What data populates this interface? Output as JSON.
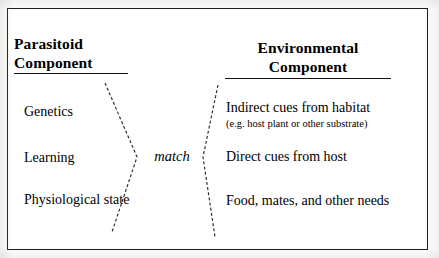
{
  "figure": {
    "border_color": "#1a1a1a",
    "background_color": "#ffffff",
    "text_color": "#000000",
    "connector_color": "#2b2b2b"
  },
  "columns": {
    "left": {
      "header_line1": "Parasitoid",
      "header_line2": "Component",
      "entries": [
        {
          "label": "Genetics"
        },
        {
          "label": "Learning"
        },
        {
          "label": "Physiological state"
        }
      ]
    },
    "right": {
      "header_line1": "Environmental",
      "header_line2": "Component",
      "entries": [
        {
          "label": "Indirect cues from habitat",
          "sublabel": "(e.g. host plant or other substrate)"
        },
        {
          "label": "Direct cues from host",
          "sublabel": ""
        },
        {
          "label": "Food, mates, and other needs",
          "sublabel": ""
        }
      ]
    }
  },
  "connector": {
    "label": "match",
    "style": "dashed",
    "left_chevron_points": "105,83 137,157 112,232",
    "right_chevron_points": "218,85 203,157 215,237"
  }
}
